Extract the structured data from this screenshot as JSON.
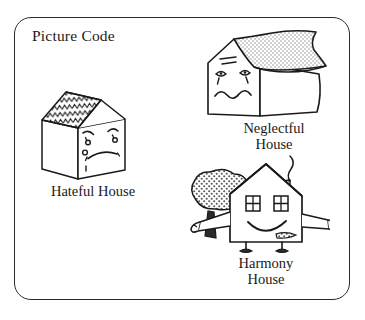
{
  "figure": {
    "title": "Picture Code",
    "border_color": "#2b2b2b",
    "ink_color": "#1a1a1a",
    "background": "#ffffff"
  },
  "items": [
    {
      "id": "hateful-house",
      "label_line1": "Hateful",
      "label_line2": "House",
      "label_full": "Hateful  House",
      "expression": "angry",
      "features": "three-dimensional box house, zigzag chevron shingled roof, angled angry eyebrows, small round eyes, deep frowning mouth",
      "roof_pattern": "zigzag"
    },
    {
      "id": "neglectful-house",
      "label_line1": "Neglectful",
      "label_line2": "House",
      "label_full": "Neglectful House",
      "expression": "sad",
      "features": "sagging swayback roof with stippled shading, droopy worried eyes with tear streaks, wavy squiggly mouth, crack lines on gable",
      "roof_pattern": "stipple"
    },
    {
      "id": "harmony-house",
      "label_line1": "Harmony",
      "label_line2": "House",
      "label_full": "Harmony House",
      "expression": "happy",
      "features": "pitched roof, two square windows as eyes, wide smiling mouth, outstretched arms with hands, legs with feet, chimney with smoke, stippled tree at left",
      "roof_pattern": "plain"
    }
  ]
}
